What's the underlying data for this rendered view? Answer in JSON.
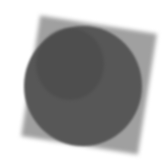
{
  "image": {
    "description": "Grayscale image of a dark circle overlapping a lighter, slightly rotated square",
    "colors": {
      "background": "#ffffff",
      "square": "#a0a0a0",
      "circle": "#575757",
      "crescent": "#474747"
    }
  }
}
